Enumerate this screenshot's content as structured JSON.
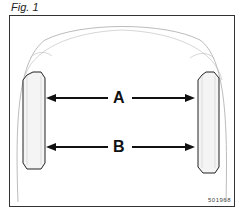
{
  "figure": {
    "label": "Fig. 1",
    "code": "501968",
    "measurements": [
      {
        "label": "A",
        "description": "distance between wheels (upper)"
      },
      {
        "label": "B",
        "description": "distance between wheels (lower)"
      }
    ]
  }
}
